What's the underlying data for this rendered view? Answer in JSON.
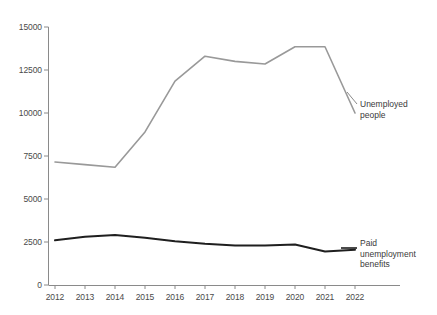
{
  "chart_data": {
    "type": "line",
    "title": "",
    "subtitle": "",
    "xlabel": "",
    "ylabel": "",
    "categories": [
      "2012",
      "2013",
      "2014",
      "2015",
      "2016",
      "2017",
      "2018",
      "2019",
      "2020",
      "2021",
      "2022"
    ],
    "x": [
      2012,
      2013,
      2014,
      2015,
      2016,
      2017,
      2018,
      2019,
      2020,
      2021,
      2022
    ],
    "xlim": [
      2012,
      2022
    ],
    "ylim": [
      0,
      15000
    ],
    "yticks": [
      0,
      2500,
      5000,
      7500,
      10000,
      12500,
      15000
    ],
    "ytick_labels": [
      "0",
      "2500",
      "5000",
      "7500",
      "10000",
      "12500",
      "15000"
    ],
    "grid": false,
    "legend": "inline-annotations-right",
    "series": [
      {
        "name": "Unemployed people",
        "color": "#999999",
        "values": [
          7150,
          7000,
          6850,
          8900,
          11850,
          13300,
          13000,
          12850,
          13850,
          13850,
          10000
        ]
      },
      {
        "name": "Paid unemployment benefits",
        "color": "#1f1f1f",
        "values": [
          2600,
          2800,
          2900,
          2750,
          2550,
          2400,
          2300,
          2300,
          2350,
          1950,
          2050
        ]
      }
    ],
    "annotations": [
      {
        "name": "unemployed-people-label",
        "lines": [
          "Unemployed",
          "people"
        ],
        "x": 360,
        "y": 99
      },
      {
        "name": "paid-unemployment-benefits-label",
        "lines": [
          "Paid",
          "unemployment",
          "benefits"
        ],
        "x": 360,
        "y": 238
      }
    ],
    "axis_color": "#8a8a8a",
    "background": "#ffffff"
  }
}
